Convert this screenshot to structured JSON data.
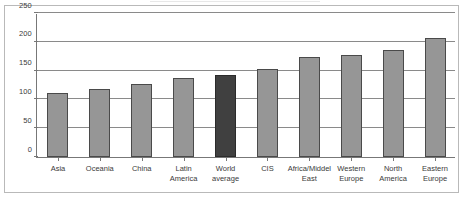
{
  "chart_data": {
    "type": "bar",
    "title": "",
    "subtitle": "",
    "xlabel": "",
    "ylabel": "",
    "ylim": [
      0,
      250
    ],
    "yticks": [
      0,
      50,
      100,
      150,
      200,
      250
    ],
    "ytick_labels": [
      "0",
      "50",
      "100",
      "150",
      "200",
      "250"
    ],
    "grid": "horizontal",
    "legend": "none",
    "categories": [
      "Asia",
      "Oceania",
      "China",
      "Latin\nAmerica",
      "World\naverage",
      "CIS",
      "Africa/Middel\nEast",
      "Western\nEurope",
      "North\nAmerica",
      "Eastern\nEurope"
    ],
    "values": [
      112,
      118,
      127,
      138,
      142,
      152,
      173,
      177,
      186,
      207
    ],
    "highlight_index": 4,
    "colors": {
      "bar_fill": "#969696",
      "bar_edge": "#4a4a4a",
      "highlight_fill": "#404040",
      "highlight_edge": "#2b2b2b",
      "gridline": "#8a8a8a",
      "axis": "#777777",
      "frame": "#b9b9b9",
      "text": "#3a3a3a",
      "background": "#ffffff"
    }
  }
}
